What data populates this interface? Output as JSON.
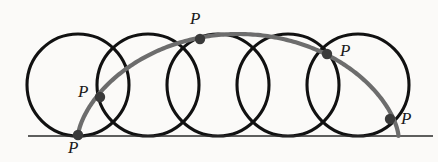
{
  "figure": {
    "background_color": "#fbfaf8",
    "width": 438,
    "height": 162
  },
  "colors": {
    "circle_stroke": "#111111",
    "baseline_stroke": "#2a2a2a",
    "cycloid_stroke": "#6d6d6d",
    "point_fill": "#3a3a3a",
    "label_color": "#1a1a1a"
  },
  "baseline": {
    "label": "rolling-line",
    "x1": 28,
    "y1": 136,
    "x2": 433,
    "y2": 136,
    "stroke_width": 1.6
  },
  "circles": {
    "count": 5,
    "radius": 51,
    "center_y": 85,
    "spacing": 70,
    "stroke_width": 3.1,
    "centers_x": [
      78,
      148,
      218,
      288,
      358
    ]
  },
  "cycloid": {
    "stroke_width": 4.2,
    "description": "one arch of a cycloid from cusp to cusp"
  },
  "points": [
    {
      "id": "p1",
      "label": "P",
      "x": 78,
      "y": 135,
      "label_x": 68,
      "label_y": 139
    },
    {
      "id": "p2",
      "label": "P",
      "x": 100,
      "y": 97,
      "label_x": 78,
      "label_y": 83
    },
    {
      "id": "p3",
      "label": "P",
      "x": 200,
      "y": 39,
      "label_x": 190,
      "label_y": 10
    },
    {
      "id": "p4",
      "label": "P",
      "x": 327,
      "y": 54,
      "label_x": 340,
      "label_y": 42
    },
    {
      "id": "p5",
      "label": "P",
      "x": 390,
      "y": 119,
      "label_x": 401,
      "label_y": 110
    }
  ],
  "point_radius": 5.2
}
